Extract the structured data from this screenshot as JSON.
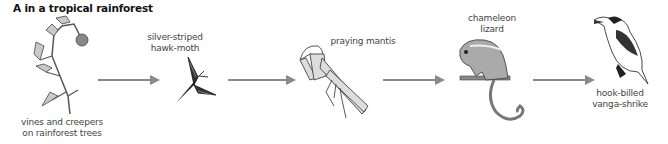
{
  "title": "A in a tropical rainforest",
  "food_chain": [
    {
      "id": "vines",
      "label_lines": [
        "vines and creepers",
        "on rainforest trees"
      ],
      "role": "producer"
    },
    {
      "id": "moth",
      "label_lines": [
        "silver-striped",
        "hawk-moth"
      ],
      "role": "primary consumer"
    },
    {
      "id": "mantis",
      "label_lines": [
        "praying mantis"
      ],
      "role": "secondary consumer"
    },
    {
      "id": "chameleon",
      "label_lines": [
        "chameleon",
        "lizard"
      ],
      "role": "tertiary consumer"
    },
    {
      "id": "shrike",
      "label_lines": [
        "hook-billed",
        "vanga-shrike"
      ],
      "role": "quaternary consumer"
    }
  ],
  "arrows": [
    {
      "from": "vines",
      "to": "moth"
    },
    {
      "from": "moth",
      "to": "mantis"
    },
    {
      "from": "mantis",
      "to": "chameleon"
    },
    {
      "from": "chameleon",
      "to": "shrike"
    }
  ],
  "colors": {
    "arrow": "#8a8a8a",
    "title": "#111111",
    "label": "#444444"
  }
}
